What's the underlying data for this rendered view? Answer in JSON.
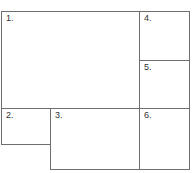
{
  "diagram": {
    "line_color": "#6e6e6e",
    "boxes": [
      {
        "label": "1.",
        "x": 1,
        "y": 11,
        "w": 139,
        "h": 98
      },
      {
        "label": "2.",
        "x": 1,
        "y": 108,
        "w": 50,
        "h": 37
      },
      {
        "label": "3.",
        "x": 50,
        "y": 108,
        "w": 90,
        "h": 62
      },
      {
        "label": "4.",
        "x": 139,
        "y": 11,
        "w": 51,
        "h": 50
      },
      {
        "label": "5.",
        "x": 139,
        "y": 60,
        "w": 51,
        "h": 49
      },
      {
        "label": "6.",
        "x": 139,
        "y": 108,
        "w": 51,
        "h": 62
      }
    ]
  }
}
